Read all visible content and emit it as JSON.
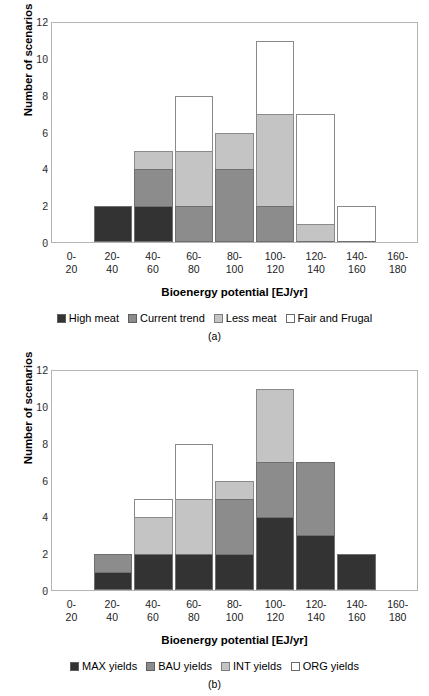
{
  "figures": [
    {
      "caption": "(a)",
      "ylabel": "Number of scenarios",
      "xlabel": "Bioenergy potential [EJ/yr]",
      "yticks": [
        "0",
        "2",
        "4",
        "6",
        "8",
        "10",
        "12"
      ],
      "xticks": [
        {
          "top": "0-",
          "bottom": "20"
        },
        {
          "top": "20-",
          "bottom": "40"
        },
        {
          "top": "40-",
          "bottom": "60"
        },
        {
          "top": "60-",
          "bottom": "80"
        },
        {
          "top": "80-",
          "bottom": "100"
        },
        {
          "top": "100-",
          "bottom": "120"
        },
        {
          "top": "120-",
          "bottom": "140"
        },
        {
          "top": "140-",
          "bottom": "160"
        },
        {
          "top": "160-",
          "bottom": "180"
        }
      ],
      "legend": [
        {
          "label": "High meat",
          "color": "#333333"
        },
        {
          "label": "Current trend",
          "color": "#8c8c8c"
        },
        {
          "label": "Less meat",
          "color": "#c4c4c4"
        },
        {
          "label": "Fair and Frugal",
          "color": "#ffffff"
        }
      ]
    },
    {
      "caption": "(b)",
      "ylabel": "Number of scenarios",
      "xlabel": "Bioenergy potential [EJ/yr]",
      "yticks": [
        "0",
        "2",
        "4",
        "6",
        "8",
        "10",
        "12"
      ],
      "xticks": [
        {
          "top": "0-",
          "bottom": "20"
        },
        {
          "top": "20-",
          "bottom": "40"
        },
        {
          "top": "40-",
          "bottom": "60"
        },
        {
          "top": "60-",
          "bottom": "80"
        },
        {
          "top": "80-",
          "bottom": "100"
        },
        {
          "top": "100-",
          "bottom": "120"
        },
        {
          "top": "120-",
          "bottom": "140"
        },
        {
          "top": "140-",
          "bottom": "160"
        },
        {
          "top": "160-",
          "bottom": "180"
        }
      ],
      "legend": [
        {
          "label": "MAX yields",
          "color": "#333333"
        },
        {
          "label": "BAU yields",
          "color": "#8c8c8c"
        },
        {
          "label": "INT yields",
          "color": "#c4c4c4"
        },
        {
          "label": "ORG yields",
          "color": "#ffffff"
        }
      ]
    }
  ],
  "chart_data": [
    {
      "type": "bar",
      "subplot": "(a)",
      "stacked": true,
      "title": "",
      "xlabel": "Bioenergy potential [EJ/yr]",
      "ylabel": "Number of scenarios",
      "ylim": [
        0,
        12
      ],
      "ytick_step": 2,
      "grid": false,
      "legend_position": "bottom",
      "categories": [
        "0-20",
        "20-40",
        "40-60",
        "60-80",
        "80-100",
        "100-120",
        "120-140",
        "140-160",
        "160-180"
      ],
      "series": [
        {
          "name": "High meat",
          "color": "#333333",
          "values": [
            0,
            2,
            2,
            0,
            0,
            0,
            0,
            0,
            0
          ]
        },
        {
          "name": "Current trend",
          "color": "#8c8c8c",
          "values": [
            0,
            0,
            2,
            2,
            4,
            2,
            0,
            0,
            0
          ]
        },
        {
          "name": "Less meat",
          "color": "#c4c4c4",
          "values": [
            0,
            0,
            1,
            3,
            2,
            5,
            1,
            0,
            0
          ]
        },
        {
          "name": "Fair and Frugal",
          "color": "#ffffff",
          "values": [
            0,
            0,
            0,
            3,
            0,
            4,
            6,
            2,
            0
          ]
        }
      ],
      "totals": [
        0,
        2,
        5,
        8,
        6,
        11,
        7,
        2,
        0
      ]
    },
    {
      "type": "bar",
      "subplot": "(b)",
      "stacked": true,
      "title": "",
      "xlabel": "Bioenergy potential [EJ/yr]",
      "ylabel": "Number of scenarios",
      "ylim": [
        0,
        12
      ],
      "ytick_step": 2,
      "grid": false,
      "legend_position": "bottom",
      "categories": [
        "0-20",
        "20-40",
        "40-60",
        "60-80",
        "80-100",
        "100-120",
        "120-140",
        "140-160",
        "160-180"
      ],
      "series": [
        {
          "name": "MAX yields",
          "color": "#333333",
          "values": [
            0,
            1,
            2,
            2,
            2,
            4,
            3,
            2,
            0
          ]
        },
        {
          "name": "BAU yields",
          "color": "#8c8c8c",
          "values": [
            0,
            1,
            0,
            0,
            3,
            3,
            4,
            0,
            0
          ]
        },
        {
          "name": "INT yields",
          "color": "#c4c4c4",
          "values": [
            0,
            0,
            2,
            3,
            1,
            4,
            0,
            0,
            0
          ]
        },
        {
          "name": "ORG yields",
          "color": "#ffffff",
          "values": [
            0,
            0,
            1,
            3,
            0,
            0,
            0,
            0,
            0
          ]
        }
      ],
      "totals": [
        0,
        2,
        5,
        8,
        6,
        11,
        7,
        2,
        0
      ]
    }
  ]
}
